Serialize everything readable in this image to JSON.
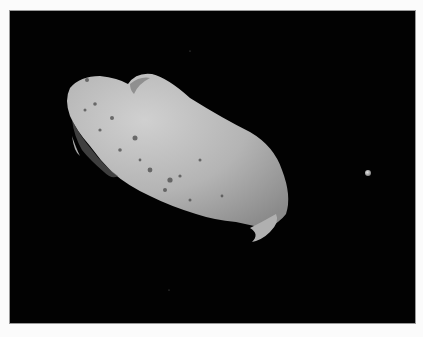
{
  "image": {
    "subject": "asteroid with small moon against black space",
    "colors": {
      "background": "#fbfbfb",
      "space": "#020202",
      "asteroid_light": "#c4c4c4",
      "asteroid_mid": "#9c9c9c",
      "asteroid_shadow": "#555555",
      "moon": "#cfcfcf"
    }
  }
}
